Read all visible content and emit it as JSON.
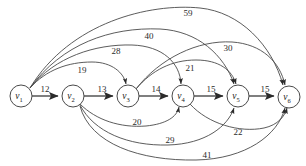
{
  "figure": {
    "type": "directed-weighted-graph",
    "background_color": "#ffffff",
    "edge_color": "#4a4a4a",
    "label_color": "#2b2b2b"
  },
  "graph_data": {
    "type": "diagram",
    "directed": true,
    "weighted": true,
    "nodes": [
      {
        "id": "v1",
        "label": "v",
        "subscript": "1",
        "cx": 21,
        "cy": 96
      },
      {
        "id": "v2",
        "label": "v",
        "subscript": "2",
        "cx": 73,
        "cy": 96
      },
      {
        "id": "v3",
        "label": "v",
        "subscript": "3",
        "cx": 128,
        "cy": 96
      },
      {
        "id": "v4",
        "label": "v",
        "subscript": "4",
        "cx": 183,
        "cy": 96
      },
      {
        "id": "v5",
        "label": "v",
        "subscript": "5",
        "cx": 238,
        "cy": 96
      },
      {
        "id": "v6",
        "label": "v",
        "subscript": "6",
        "cx": 289,
        "cy": 97
      }
    ],
    "node_radius": 11,
    "edges": [
      {
        "from": "v1",
        "to": "v2",
        "weight": 12,
        "label_x": 45,
        "label_y": 89
      },
      {
        "from": "v2",
        "to": "v3",
        "weight": 13,
        "label_x": 102,
        "label_y": 89
      },
      {
        "from": "v3",
        "to": "v4",
        "weight": 14,
        "label_x": 156,
        "label_y": 89
      },
      {
        "from": "v4",
        "to": "v5",
        "weight": 15,
        "label_x": 211,
        "label_y": 89
      },
      {
        "from": "v5",
        "to": "v6",
        "weight": 15,
        "label_x": 265,
        "label_y": 89
      },
      {
        "from": "v1",
        "to": "v3",
        "weight": 19,
        "label_x": 82,
        "label_y": 70
      },
      {
        "from": "v1",
        "to": "v4",
        "weight": 28,
        "label_x": 116,
        "label_y": 51
      },
      {
        "from": "v1",
        "to": "v5",
        "weight": 40,
        "label_x": 149,
        "label_y": 36
      },
      {
        "from": "v1",
        "to": "v6",
        "weight": 59,
        "label_x": 188,
        "label_y": 13
      },
      {
        "from": "v3",
        "to": "v6",
        "weight": 30,
        "label_x": 228,
        "label_y": 48
      },
      {
        "from": "v3",
        "to": "v5",
        "weight": 21,
        "label_x": 190,
        "label_y": 68
      },
      {
        "from": "v2",
        "to": "v4",
        "weight": 20,
        "label_x": 137,
        "label_y": 122
      },
      {
        "from": "v2",
        "to": "v5",
        "weight": 29,
        "label_x": 170,
        "label_y": 140
      },
      {
        "from": "v2",
        "to": "v6",
        "weight": 41,
        "label_x": 207,
        "label_y": 155
      },
      {
        "from": "v4",
        "to": "v6",
        "weight": 22,
        "label_x": 238,
        "label_y": 132
      }
    ]
  }
}
